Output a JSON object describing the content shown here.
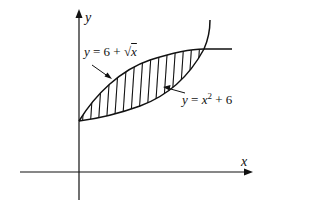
{
  "figure": {
    "axes": {
      "x_label": "x",
      "y_label": "y"
    },
    "curves": [
      {
        "id": "sqrt-curve",
        "label_parts": {
          "y": "y",
          "eq": " = 6 + ",
          "root": "√",
          "x": "x"
        },
        "label_text": "y = 6 + √x"
      },
      {
        "id": "square-curve",
        "label_parts": {
          "y": "y",
          "eq": " = ",
          "x": "x",
          "exp": "2",
          "rest": " + 6"
        },
        "label_text": "y = x² + 6"
      }
    ],
    "shaded_region": "area between curves from x = 0 to x = 1 (vertical hatching)",
    "colors": {
      "stroke": "#111111",
      "background": "#ffffff"
    }
  }
}
